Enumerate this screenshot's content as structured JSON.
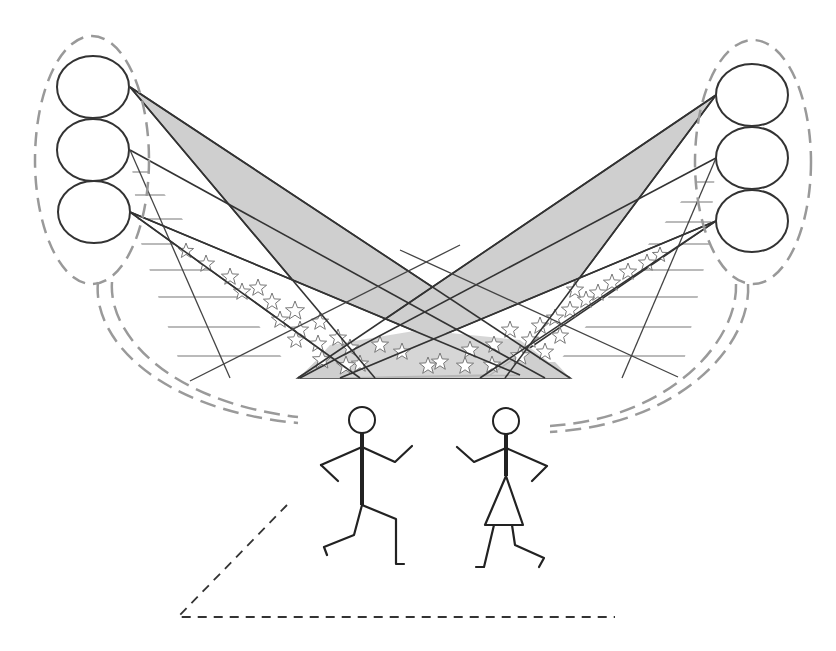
{
  "diagram": {
    "colors": {
      "background": "#ffffff",
      "lamp_stroke": "#333333",
      "group_outline": "#999999",
      "beam_fill": "#cfcfcf",
      "stripe": "#777777",
      "star_outline": "#777777",
      "cable": "#9a9a9a",
      "figure": "#222222",
      "floor_outline": "#333333"
    },
    "left_cluster": {
      "name": "left-lamp-cluster",
      "lamps": [
        {
          "cx": 93,
          "cy": 87,
          "rx": 36,
          "ry": 31
        },
        {
          "cx": 93,
          "cy": 150,
          "rx": 36,
          "ry": 31
        },
        {
          "cx": 94,
          "cy": 212,
          "rx": 36,
          "ry": 31
        }
      ],
      "outline": {
        "cx": 92,
        "cy": 160,
        "rx": 57,
        "ry": 124
      }
    },
    "right_cluster": {
      "name": "right-lamp-cluster",
      "lamps": [
        {
          "cx": 752,
          "cy": 95,
          "rx": 36,
          "ry": 31
        },
        {
          "cx": 752,
          "cy": 158,
          "rx": 36,
          "ry": 31
        },
        {
          "cx": 752,
          "cy": 221,
          "rx": 36,
          "ry": 31
        }
      ],
      "outline": {
        "cx": 753,
        "cy": 162,
        "rx": 58,
        "ry": 122
      }
    },
    "beams": {
      "gray": "solid gray fill",
      "striped": "horizontal line pattern",
      "starred": "star pattern"
    },
    "figures": [
      {
        "name": "male-dancer",
        "role": "man"
      },
      {
        "name": "female-dancer",
        "role": "woman"
      }
    ],
    "stage_floor": "dashed outline"
  }
}
